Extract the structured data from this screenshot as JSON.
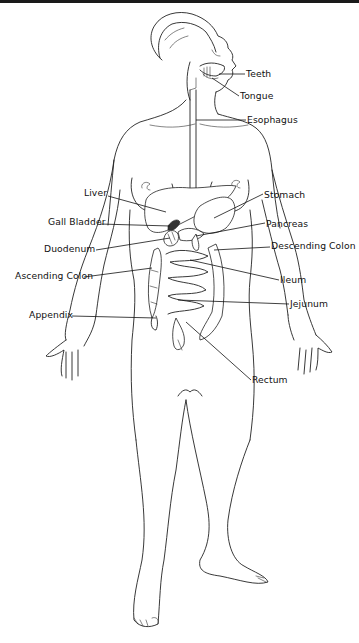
{
  "diagram": {
    "background": "#ffffff",
    "line_color": "#222222",
    "labels": [
      {
        "id": "teeth",
        "text": "Teeth",
        "x": 246,
        "y": 69,
        "side": "right"
      },
      {
        "id": "tongue",
        "text": "Tongue",
        "x": 240,
        "y": 91,
        "side": "right"
      },
      {
        "id": "esophagus",
        "text": "Esophagus",
        "x": 247,
        "y": 120,
        "side": "right"
      },
      {
        "id": "liver",
        "text": "Liver",
        "x": 84,
        "y": 188,
        "side": "left"
      },
      {
        "id": "gall-bladder",
        "text": "Gall Bladder",
        "x": 48,
        "y": 217,
        "side": "left"
      },
      {
        "id": "duodenum",
        "text": "Duodenum",
        "x": 44,
        "y": 244,
        "side": "left"
      },
      {
        "id": "ascending-colon",
        "text": "Ascending Colon",
        "x": 15,
        "y": 271,
        "side": "left"
      },
      {
        "id": "appendix",
        "text": "Appendix",
        "x": 29,
        "y": 310,
        "side": "left"
      },
      {
        "id": "stomach",
        "text": "Stomach",
        "x": 264,
        "y": 190,
        "side": "right"
      },
      {
        "id": "pancreas",
        "text": "Pancreas",
        "x": 266,
        "y": 219,
        "side": "right"
      },
      {
        "id": "descending-colon",
        "text": "Descending Colon",
        "x": 271,
        "y": 241,
        "side": "right"
      },
      {
        "id": "ileum",
        "text": "Ileum",
        "x": 280,
        "y": 275,
        "side": "right"
      },
      {
        "id": "jejunum",
        "text": "Jejunum",
        "x": 290,
        "y": 299,
        "side": "right"
      },
      {
        "id": "rectum",
        "text": "Rectum",
        "x": 252,
        "y": 377,
        "side": "right"
      }
    ]
  }
}
